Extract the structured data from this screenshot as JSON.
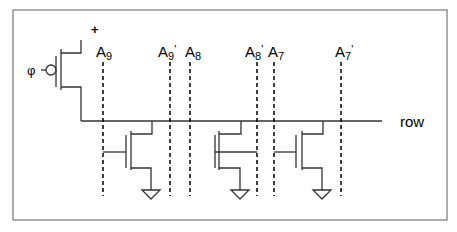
{
  "diagram": {
    "supply_label": "+",
    "clock_label": "φ",
    "row_label": "row",
    "address_lines": [
      {
        "base": "A",
        "sub": "9",
        "prime": ""
      },
      {
        "base": "A",
        "sub": "9",
        "prime": "'"
      },
      {
        "base": "A",
        "sub": "8",
        "prime": ""
      },
      {
        "base": "A",
        "sub": "8",
        "prime": "'"
      },
      {
        "base": "A",
        "sub": "7",
        "prime": ""
      },
      {
        "base": "A",
        "sub": "7",
        "prime": "'"
      }
    ],
    "pulldown_transistors": [
      {
        "gate_input": "A9"
      },
      {
        "gate_input": "A8'"
      },
      {
        "gate_input": "A7"
      }
    ],
    "colors": {
      "wire": "#333333",
      "frame": "#777777",
      "text": "#000000"
    }
  }
}
